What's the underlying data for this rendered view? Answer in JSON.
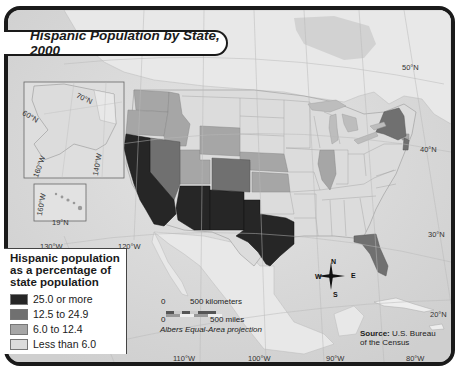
{
  "map": {
    "title": "Hispanic Population by State, 2000",
    "projection": "Albers Equal-Area projection",
    "source_label": "Source:",
    "source_text": "U.S. Bureau of the Census",
    "source_line1": "U.S. Bureau",
    "source_line2": "of the Census",
    "colors": {
      "water": "#d6d6d6",
      "land": "#e6e6e6",
      "tier1": "#262626",
      "tier2": "#707070",
      "tier3": "#a6a6a6",
      "tier4": "#dcdcdc"
    }
  },
  "legend": {
    "title": "Hispanic population as a percentage of state population",
    "title_line1": "Hispanic population",
    "title_line2": "as a percentage of",
    "title_line3": "state population",
    "items": [
      {
        "label": "25.0 or more",
        "color": "#262626"
      },
      {
        "label": "12.5 to 24.9",
        "color": "#707070"
      },
      {
        "label": "6.0 to 12.4",
        "color": "#a6a6a6"
      },
      {
        "label": "Less than 6.0",
        "color": "#dcdcdc"
      }
    ]
  },
  "scale": {
    "top_zero": "0",
    "top_label": "500 kilometers",
    "bottom_zero": "0",
    "bottom_label": "500 miles"
  },
  "compass": {
    "n": "N",
    "s": "S",
    "e": "E",
    "w": "W"
  },
  "grid_labels": {
    "lat_50": "50°N",
    "lat_40": "40°N",
    "lat_30": "30°N",
    "lat_20": "20°N",
    "lon_130": "130°W",
    "lon_120": "120°W",
    "lon_110": "110°W",
    "lon_100": "100°W",
    "lon_90": "90°W",
    "lon_80": "80°W"
  },
  "insets": {
    "alaska": {
      "lat_70": "70°N",
      "lat_60": "60°N",
      "lon_160": "160°W",
      "lon_140": "140°W"
    },
    "hawaii": {
      "lon_160": "160°W",
      "lat_19": "19°N"
    }
  },
  "state_categories": {
    "25.0 or more": [
      "California",
      "Arizona",
      "New Mexico",
      "Texas"
    ],
    "12.5 to 24.9": [
      "Nevada",
      "Colorado",
      "Florida",
      "New York",
      "New Jersey"
    ],
    "6.0 to 12.4": [
      "Washington",
      "Oregon",
      "Idaho",
      "Utah",
      "Wyoming",
      "Kansas",
      "Nebraska",
      "Illinois",
      "Connecticut",
      "Rhode Island"
    ],
    "Less than 6.0": [
      "Montana",
      "North Dakota",
      "South Dakota",
      "Minnesota",
      "Iowa",
      "Missouri",
      "Oklahoma",
      "Arkansas",
      "Louisiana",
      "Wisconsin",
      "Michigan",
      "Indiana",
      "Ohio",
      "Kentucky",
      "Tennessee",
      "Mississippi",
      "Alabama",
      "Georgia",
      "South Carolina",
      "North Carolina",
      "Virginia",
      "West Virginia",
      "Pennsylvania",
      "Maryland",
      "Delaware",
      "Vermont",
      "New Hampshire",
      "Maine",
      "Massachusetts",
      "Alaska",
      "Hawaii"
    ]
  }
}
